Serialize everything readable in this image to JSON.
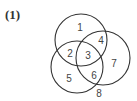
{
  "figure": {
    "label": "(1)"
  },
  "venn": {
    "circles": [
      {
        "name": "top",
        "cx": 81,
        "cy": 40,
        "r": 26
      },
      {
        "name": "right",
        "cx": 103,
        "cy": 58,
        "r": 27
      },
      {
        "name": "left",
        "cx": 77,
        "cy": 67,
        "r": 26
      }
    ],
    "regions": [
      {
        "label": "1",
        "x": 80,
        "y": 31
      },
      {
        "label": "2",
        "x": 70,
        "y": 57
      },
      {
        "label": "3",
        "x": 88,
        "y": 59
      },
      {
        "label": "4",
        "x": 101,
        "y": 44
      },
      {
        "label": "5",
        "x": 69,
        "y": 82
      },
      {
        "label": "6",
        "x": 94,
        "y": 79
      },
      {
        "label": "7",
        "x": 114,
        "y": 67
      },
      {
        "label": "8",
        "x": 99,
        "y": 97
      }
    ],
    "stroke_color": "#333333"
  }
}
